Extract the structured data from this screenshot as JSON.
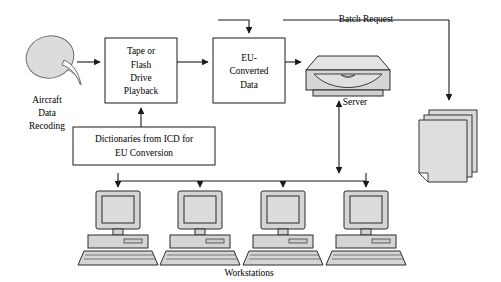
{
  "diagram": {
    "type": "flowchart",
    "background_color": "#ffffff",
    "line_color": "#1a1a1a",
    "fill_gray": "#d8d8d8",
    "nodes": {
      "source": {
        "name": "aircraft-data-recording",
        "icon": "dish-icon",
        "caption_lines": [
          "Aircraft",
          "Data",
          "Recoding"
        ]
      },
      "playback": {
        "name": "tape-or-flash-drive-playback",
        "shape": "rectangle",
        "lines": [
          "Tape or",
          "Flash",
          "Drive",
          "Playback"
        ]
      },
      "converted": {
        "name": "eu-converted-data",
        "shape": "rectangle",
        "lines": [
          "EU-",
          "Converted",
          "Data"
        ]
      },
      "dictionaries": {
        "name": "dictionaries-from-icd",
        "shape": "rectangle",
        "lines": [
          "Dictionaries from ICD for",
          "EU Conversion"
        ]
      },
      "server": {
        "name": "server",
        "icon": "server-icon",
        "caption": "Server"
      },
      "reports": {
        "name": "report-stack",
        "icon": "document-stack-icon",
        "sheet_count": 3
      },
      "workstations": {
        "name": "workstations",
        "icon": "desktop-computer-icon",
        "count": 4,
        "caption": "Workstations"
      }
    },
    "edges": [
      {
        "name": "edge-source-to-playback",
        "from": "source",
        "to": "playback",
        "label": "",
        "arrow": "single"
      },
      {
        "name": "edge-playback-to-converted",
        "from": "playback",
        "to": "converted",
        "label": "",
        "arrow": "single"
      },
      {
        "name": "edge-dictionaries-to-playback",
        "from": "dictionaries",
        "to": "playback",
        "label": "",
        "arrow": "single"
      },
      {
        "name": "edge-converted-to-server",
        "from": "converted",
        "to": "server",
        "label": "",
        "arrow": "single"
      },
      {
        "name": "edge-batch-request",
        "from": "reports",
        "to": "converted",
        "label": "Batch Request",
        "arrow": "single"
      },
      {
        "name": "edge-batch-to-reports",
        "from": "batch-bus",
        "to": "reports",
        "label": "",
        "arrow": "single"
      },
      {
        "name": "edge-server-to-bus",
        "from": "server",
        "to": "workstation-bus",
        "label": "",
        "arrow": "double"
      },
      {
        "name": "edge-bus-to-workstation-1",
        "from": "workstation-bus",
        "to": "workstation-1",
        "label": "",
        "arrow": "single"
      },
      {
        "name": "edge-bus-to-workstation-2",
        "from": "workstation-bus",
        "to": "workstation-2",
        "label": "",
        "arrow": "single"
      },
      {
        "name": "edge-bus-to-workstation-3",
        "from": "workstation-bus",
        "to": "workstation-3",
        "label": "",
        "arrow": "single"
      },
      {
        "name": "edge-bus-to-workstation-4",
        "from": "workstation-bus",
        "to": "workstation-4",
        "label": "",
        "arrow": "single"
      }
    ],
    "labels": {
      "batch_request": "Batch Request",
      "server": "Server",
      "workstations": "Workstations",
      "source_line_1": "Aircraft",
      "source_line_2": "Data",
      "source_line_3": "Recoding",
      "playback_line_1": "Tape or",
      "playback_line_2": "Flash",
      "playback_line_3": "Drive",
      "playback_line_4": "Playback",
      "converted_line_1": "EU-",
      "converted_line_2": "Converted",
      "converted_line_3": "Data",
      "dictionaries_line_1": "Dictionaries from ICD for",
      "dictionaries_line_2": "EU Conversion"
    }
  }
}
